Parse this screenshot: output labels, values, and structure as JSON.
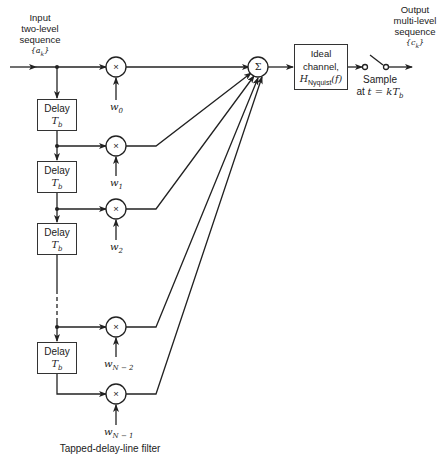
{
  "input": {
    "line1": "Input",
    "line2": "two-level",
    "line3": "sequence",
    "symbol": "{a_k}",
    "symbol_text": "{a",
    "symbol_sub": "k",
    "symbol_close": "}"
  },
  "output": {
    "line1": "Output",
    "line2": "multi-level",
    "line3": "sequence",
    "symbol_text": "{c",
    "symbol_sub": "k",
    "symbol_close": "}"
  },
  "delay": {
    "label": "Delay",
    "symbol": "T",
    "symbol_sub": "b"
  },
  "delays": [
    {
      "label": "Delay",
      "symbol": "T",
      "sub": "b"
    },
    {
      "label": "Delay",
      "symbol": "T",
      "sub": "b"
    },
    {
      "label": "Delay",
      "symbol": "T",
      "sub": "b"
    },
    {
      "label": "Delay",
      "symbol": "T",
      "sub": "b"
    }
  ],
  "weights": [
    {
      "base": "w",
      "sub": "0"
    },
    {
      "base": "w",
      "sub": "1"
    },
    {
      "base": "w",
      "sub": "2"
    },
    {
      "base": "w",
      "sub": "N − 2"
    },
    {
      "base": "w",
      "sub": "N − 1"
    }
  ],
  "multiplier_symbol": "×",
  "summer_symbol": "Σ",
  "channel": {
    "line1": "Ideal",
    "line2": "channel,",
    "h": "H",
    "h_sub": "Nyquist",
    "h_arg": "(f)"
  },
  "sampler": {
    "line1": "Sample",
    "line2_prefix": "at ",
    "line2_expr": "t = kT",
    "line2_sub": "b"
  },
  "caption": "Tapped-delay-line filter"
}
